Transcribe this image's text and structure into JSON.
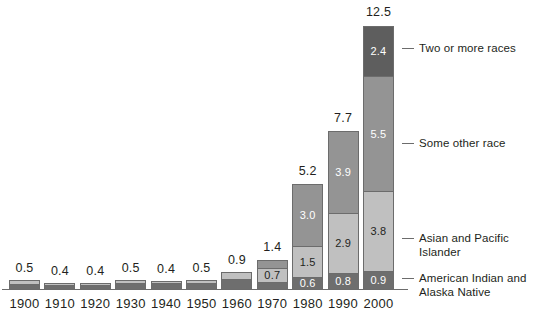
{
  "chart_data": {
    "type": "bar",
    "subtype": "stacked-bar",
    "title": "",
    "xlabel": "",
    "ylabel": "",
    "ylim": [
      0,
      12.5
    ],
    "grid": false,
    "legend_position": "right",
    "categories": [
      "1900",
      "1910",
      "1920",
      "1930",
      "1940",
      "1950",
      "1960",
      "1970",
      "1980",
      "1990",
      "2000"
    ],
    "totals": [
      "0.5",
      "0.4",
      "0.4",
      "0.5",
      "0.4",
      "0.5",
      "0.9",
      "1.4",
      "5.2",
      "7.7",
      "12.5"
    ],
    "series": [
      {
        "name": "American Indian and\nAlaska Native",
        "color": "#6e6e6e",
        "values": [
          0.3,
          0.25,
          0.25,
          0.33,
          0.33,
          0.34,
          0.52,
          0.4,
          0.6,
          0.8,
          0.9
        ],
        "labels": [
          "",
          "",
          "",
          "",
          "",
          "",
          "",
          "0.4",
          "0.6",
          "0.8",
          "0.9"
        ]
      },
      {
        "name": "Asian and Pacific Islander",
        "color": "#c0c0c0",
        "values": [
          0.2,
          0.15,
          0.15,
          0.17,
          0.12,
          0.16,
          0.38,
          0.7,
          1.5,
          2.9,
          3.8
        ],
        "labels": [
          "",
          "",
          "",
          "",
          "",
          "",
          "",
          "0.7",
          "1.5",
          "2.9",
          "3.8"
        ]
      },
      {
        "name": "Some other race",
        "color": "#949494",
        "values": [
          0,
          0,
          0,
          0,
          0,
          0,
          0,
          0.4,
          3.0,
          3.9,
          5.5
        ],
        "labels": [
          "",
          "",
          "",
          "",
          "",
          "",
          "",
          "0.4",
          "3.0",
          "3.9",
          "5.5"
        ]
      },
      {
        "name": "Two or more races",
        "color": "#5e5e5e",
        "values": [
          0,
          0,
          0,
          0,
          0,
          0,
          0,
          0,
          0,
          0,
          2.4
        ],
        "labels": [
          "",
          "",
          "",
          "",
          "",
          "",
          "",
          "",
          "",
          "",
          "2.4"
        ]
      }
    ]
  },
  "legend": {
    "entries": [
      {
        "label": "Two or more races",
        "color": "#5e5e5e"
      },
      {
        "label": "Some other race",
        "color": "#949494"
      },
      {
        "label": "Asian and Pacific Islander",
        "color": "#c0c0c0"
      },
      {
        "label": "American Indian and\nAlaska Native",
        "color": "#6e6e6e"
      }
    ]
  },
  "axis": {
    "tick_labels": [
      "1900",
      "1910",
      "1920",
      "1930",
      "1940",
      "1950",
      "1960",
      "1970",
      "1980",
      "1990",
      "2000"
    ]
  }
}
